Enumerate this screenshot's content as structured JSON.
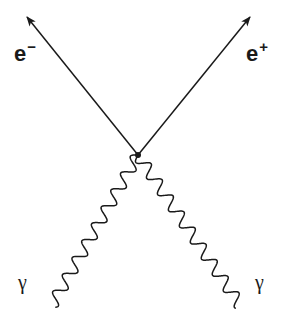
{
  "diagram": {
    "type": "feynman-diagram",
    "process": "pair production / annihilation vertex",
    "vertex": {
      "x": 138,
      "y": 155
    },
    "lines": {
      "electron": {
        "kind": "fermion",
        "label_base": "e",
        "label_sup": "−",
        "from": {
          "x": 138,
          "y": 155
        },
        "to": {
          "x": 27,
          "y": 17
        },
        "arrow": "outgoing"
      },
      "positron": {
        "kind": "fermion",
        "label_base": "e",
        "label_sup": "+",
        "from": {
          "x": 138,
          "y": 155
        },
        "to": {
          "x": 250,
          "y": 17
        },
        "arrow": "outgoing"
      },
      "photon_left": {
        "kind": "photon",
        "label": "γ",
        "from": {
          "x": 138,
          "y": 155
        },
        "to": {
          "x": 52,
          "y": 305
        }
      },
      "photon_right": {
        "kind": "photon",
        "label": "γ",
        "from": {
          "x": 138,
          "y": 155
        },
        "to": {
          "x": 240,
          "y": 305
        }
      }
    },
    "colors": {
      "line": "#1a1a1a",
      "background": "#ffffff"
    }
  }
}
